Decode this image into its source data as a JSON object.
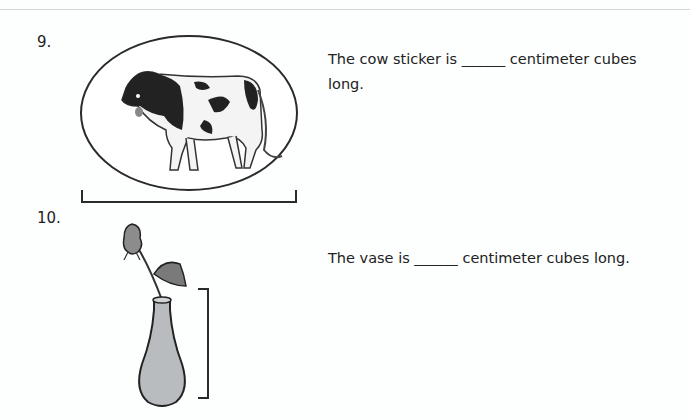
{
  "worksheet": {
    "questions": [
      {
        "number": "9.",
        "text_before": "The cow sticker is",
        "blank": "______",
        "text_after": "centimeter cubes long.",
        "line1": "The cow sticker is ______ centimeter cubes",
        "line2": "long.",
        "image": "cow-sticker-in-oval",
        "measure_bracket": "horizontal"
      },
      {
        "number": "10.",
        "text": "The vase is ______ centimeter cubes long.",
        "image": "rose-in-vase",
        "measure_bracket": "vertical"
      }
    ]
  },
  "colors": {
    "background": "#fdfefe",
    "ink": "#222222",
    "vase_fill": "#b8bcbe",
    "rose_fill": "#8c8c8c"
  }
}
